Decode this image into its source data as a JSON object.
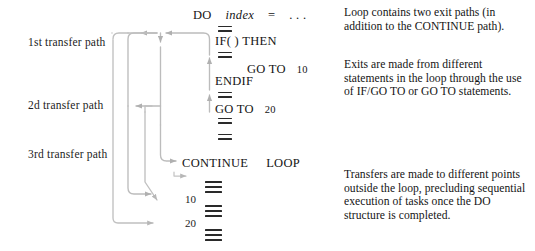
{
  "figure": {
    "type": "control-flow-diagram",
    "line_color": "#b9b9b9",
    "text_color": "#141414"
  },
  "path_labels": [
    {
      "id": "1st",
      "text": "1st transfer path"
    },
    {
      "id": "2d",
      "text": "2d transfer path"
    },
    {
      "id": "3rd",
      "text": "3rd transfer path"
    }
  ],
  "code": {
    "do_keyword": "DO",
    "do_variable": "index",
    "do_equals": "=",
    "do_ellipsis": ". . .",
    "if_then": "IF(  ) THEN",
    "goto_10": "GO TO",
    "goto_10_label": "10",
    "endif": "ENDIF",
    "goto_20": "GO TO",
    "goto_20_label": "20",
    "continue": "CONTINUE",
    "loop": "LOOP",
    "target_label_10": "10",
    "target_label_20": "20"
  },
  "notes": [
    {
      "id": "note-1",
      "text": "Loop contains two exit paths (in addition to the CONTINUE path)."
    },
    {
      "id": "note-2",
      "text": "Exits are made from different statements in the loop through the use of IF/GO TO or GO TO statements."
    },
    {
      "id": "note-3",
      "text": "Transfers are made to different points outside the loop, precluding sequential execution of tasks once the DO structure is completed."
    }
  ]
}
